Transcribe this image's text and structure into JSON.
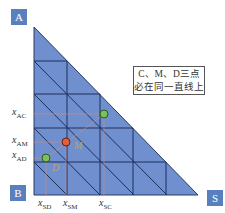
{
  "vertices": {
    "A": "A",
    "B": "B",
    "S": "S"
  },
  "y_axis_labels": [
    {
      "main": "x",
      "sub": "AC"
    },
    {
      "main": "x",
      "sub": "AM"
    },
    {
      "main": "x",
      "sub": "AD"
    }
  ],
  "x_axis_labels": [
    {
      "main": "x",
      "sub": "SD"
    },
    {
      "main": "x",
      "sub": "SM"
    },
    {
      "main": "x",
      "sub": "SC"
    }
  ],
  "points": {
    "C": {
      "label": "C",
      "color": "#7cc05a"
    },
    "M": {
      "label": "M",
      "color": "#e0603a"
    },
    "D": {
      "label": "D",
      "color": "#7cc05a"
    }
  },
  "note": {
    "line1": "C、M、D三点",
    "line2": "必在同一直线上"
  },
  "colors": {
    "triangle_fill": "#6f8fcf",
    "grid": "#1e2f5a",
    "label_box": "#5a7fbf",
    "guide": "#d98a7a"
  }
}
